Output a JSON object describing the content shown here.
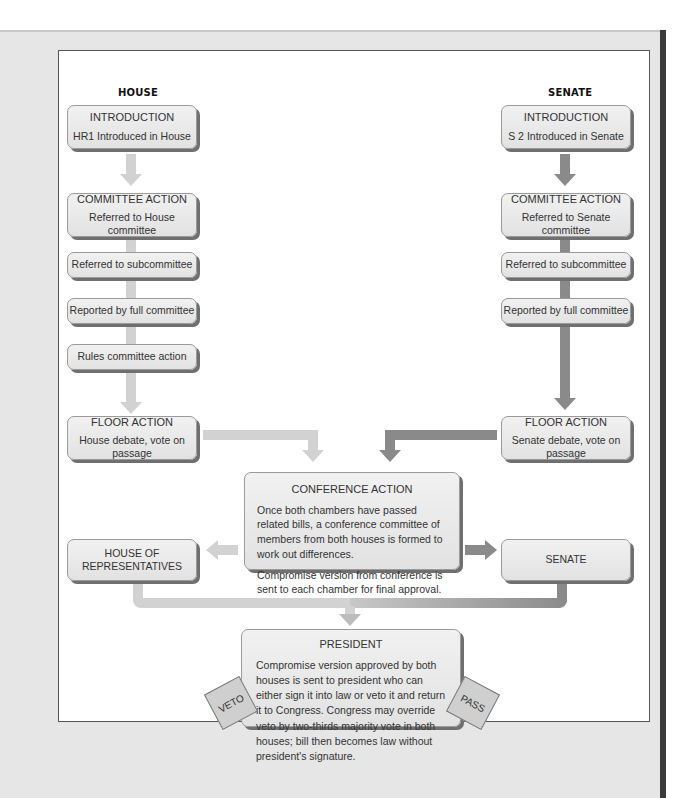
{
  "diagram": {
    "columns": {
      "house": "HOUSE",
      "senate": "SENATE"
    },
    "house": {
      "introduction": {
        "title": "INTRODUCTION",
        "text": "HR1 Introduced in House"
      },
      "committee": {
        "title": "COMMITTEE ACTION",
        "text": "Referred to House committee"
      },
      "subcommittee": "Referred to subcommittee",
      "reported": "Reported by full committee",
      "rules": "Rules committee action",
      "floor": {
        "title": "FLOOR  ACTION",
        "text": "House debate, vote on passage"
      },
      "final": "HOUSE OF REPRESENTATIVES"
    },
    "senate": {
      "introduction": {
        "title": "INTRODUCTION",
        "text": "S 2 Introduced in Senate"
      },
      "committee": {
        "title": "COMMITTEE ACTION",
        "text": "Referred to Senate committee"
      },
      "subcommittee": "Referred to subcommittee",
      "reported": "Reported by full committee",
      "floor": {
        "title": "FLOOR  ACTION",
        "text": "Senate debate, vote on passage"
      },
      "final": "SENATE"
    },
    "conference": {
      "title": "CONFERENCE ACTION",
      "p1": "Once both chambers have passed related bills, a conference committee of members from both houses is formed to work out differences.",
      "p2": "Compromise version from conference is sent to each chamber for final approval."
    },
    "president": {
      "title": "PRESIDENT",
      "text": "Compromise version approved by both houses is sent to president who can either sign it into law or veto it and return it to Congress. Congress may override veto by two-thirds majority vote in both houses; bill then becomes law without president's signature.",
      "veto": "VETO",
      "pass": "PASS"
    },
    "colors": {
      "house_arrow": "#d2d2d2",
      "senate_arrow": "#8a8a8a",
      "box_fill": "#e8e8e8",
      "box_shadow": "#6f6f6f"
    }
  }
}
